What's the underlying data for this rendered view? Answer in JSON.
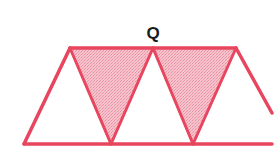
{
  "diagram": {
    "label": "Q",
    "colors": {
      "stroke": "#e8455e",
      "shaded_fill": "#f4b7c3",
      "background": "#ffffff",
      "label": "#1a1a1a"
    },
    "shapes": {
      "trapezoid_count": 1,
      "triangle_count": 5,
      "shaded_triangle_count": 2
    }
  }
}
